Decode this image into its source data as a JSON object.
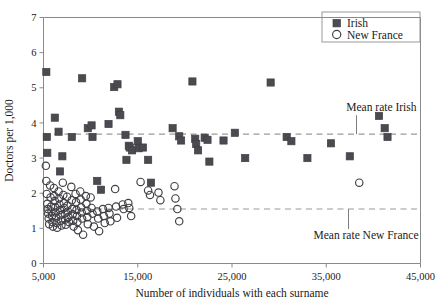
{
  "chart_data": {
    "type": "scatter",
    "title": "",
    "xlabel": "Number of individuals with each surname",
    "ylabel": "Doctors per 1,000",
    "xlim": [
      5000,
      45000
    ],
    "ylim": [
      0,
      7
    ],
    "xticks": [
      5000,
      15000,
      25000,
      35000,
      45000
    ],
    "xticklabels": [
      "5,000",
      "15,000",
      "25,000",
      "35,000",
      "45,000"
    ],
    "yticks": [
      0,
      1,
      2,
      3,
      4,
      5,
      6,
      7
    ],
    "yticklabels": [
      "0",
      "1",
      "2",
      "3",
      "4",
      "5",
      "6",
      "7"
    ],
    "grid": false,
    "legend_position": "top-right",
    "legend": [
      {
        "name": "Irish",
        "marker": "filled-square",
        "color": "#4a4a50"
      },
      {
        "name": "New France",
        "marker": "open-circle",
        "color": "#3f3f44"
      }
    ],
    "annotations": [
      {
        "text": "Mean rate Irish",
        "y_value": 3.68
      },
      {
        "text": "Mean rate New France",
        "y_value": 1.55
      }
    ],
    "reference_lines": [
      {
        "label": "Mean rate Irish",
        "series": "Irish",
        "y": 3.68,
        "style": "dashed"
      },
      {
        "label": "Mean rate New France",
        "series": "New France",
        "y": 1.55,
        "style": "dashed"
      }
    ],
    "series": [
      {
        "name": "Irish",
        "marker": "filled-square",
        "color": "#4a4a50",
        "points": [
          [
            5300,
            5.45
          ],
          [
            5350,
            3.6
          ],
          [
            5400,
            3.15
          ],
          [
            6200,
            4.15
          ],
          [
            6600,
            3.75
          ],
          [
            6750,
            2.62
          ],
          [
            7000,
            3.05
          ],
          [
            8000,
            3.6
          ],
          [
            9100,
            5.27
          ],
          [
            9700,
            3.85
          ],
          [
            10100,
            3.93
          ],
          [
            10200,
            3.6
          ],
          [
            10700,
            2.35
          ],
          [
            11100,
            2.1
          ],
          [
            11900,
            3.97
          ],
          [
            12500,
            5.02
          ],
          [
            12850,
            5.1
          ],
          [
            13000,
            4.32
          ],
          [
            13150,
            4.22
          ],
          [
            13700,
            3.66
          ],
          [
            13800,
            2.95
          ],
          [
            14050,
            3.35
          ],
          [
            14150,
            3.3
          ],
          [
            14400,
            3.22
          ],
          [
            15000,
            3.48
          ],
          [
            15100,
            3.28
          ],
          [
            15550,
            3.3
          ],
          [
            16100,
            2.95
          ],
          [
            16400,
            2.3
          ],
          [
            18700,
            3.85
          ],
          [
            19400,
            3.62
          ],
          [
            19600,
            3.5
          ],
          [
            20800,
            5.18
          ],
          [
            21100,
            3.55
          ],
          [
            21200,
            3.4
          ],
          [
            21400,
            3.22
          ],
          [
            22100,
            3.58
          ],
          [
            22400,
            3.52
          ],
          [
            22600,
            2.9
          ],
          [
            24100,
            3.5
          ],
          [
            25300,
            3.72
          ],
          [
            26400,
            3.0
          ],
          [
            29100,
            5.15
          ],
          [
            30800,
            3.6
          ],
          [
            31300,
            3.48
          ],
          [
            33000,
            3.0
          ],
          [
            35500,
            3.42
          ],
          [
            37500,
            3.05
          ],
          [
            40600,
            4.2
          ],
          [
            41200,
            3.85
          ],
          [
            41500,
            3.6
          ]
        ]
      },
      {
        "name": "New France",
        "marker": "open-circle",
        "color": "#3f3f44",
        "points": [
          [
            5250,
            2.78
          ],
          [
            5300,
            2.35
          ],
          [
            5350,
            1.98
          ],
          [
            5400,
            1.7
          ],
          [
            5450,
            1.55
          ],
          [
            5500,
            1.42
          ],
          [
            5550,
            1.28
          ],
          [
            5600,
            1.12
          ],
          [
            5700,
            2.22
          ],
          [
            5750,
            1.88
          ],
          [
            5800,
            1.62
          ],
          [
            5850,
            1.48
          ],
          [
            5900,
            1.35
          ],
          [
            5950,
            1.18
          ],
          [
            6000,
            1.05
          ],
          [
            6100,
            2.15
          ],
          [
            6150,
            1.92
          ],
          [
            6200,
            1.78
          ],
          [
            6250,
            1.6
          ],
          [
            6300,
            1.45
          ],
          [
            6350,
            1.3
          ],
          [
            6400,
            1.15
          ],
          [
            6450,
            1.02
          ],
          [
            6600,
            2.05
          ],
          [
            6650,
            1.85
          ],
          [
            6700,
            1.68
          ],
          [
            6750,
            1.52
          ],
          [
            6800,
            1.38
          ],
          [
            6850,
            1.22
          ],
          [
            6900,
            1.08
          ],
          [
            7050,
            2.3
          ],
          [
            7100,
            1.95
          ],
          [
            7150,
            1.72
          ],
          [
            7200,
            1.58
          ],
          [
            7250,
            1.42
          ],
          [
            7300,
            1.25
          ],
          [
            7350,
            1.1
          ],
          [
            7500,
            1.9
          ],
          [
            7550,
            1.65
          ],
          [
            7600,
            1.48
          ],
          [
            7650,
            1.32
          ],
          [
            7700,
            1.18
          ],
          [
            7950,
            2.18
          ],
          [
            8000,
            1.8
          ],
          [
            8050,
            1.55
          ],
          [
            8100,
            1.4
          ],
          [
            8150,
            1.22
          ],
          [
            8200,
            1.05
          ],
          [
            8400,
            1.98
          ],
          [
            8450,
            1.75
          ],
          [
            8500,
            1.52
          ],
          [
            8550,
            1.35
          ],
          [
            8600,
            1.18
          ],
          [
            8650,
            0.95
          ],
          [
            8900,
            2.05
          ],
          [
            8950,
            1.82
          ],
          [
            9000,
            1.6
          ],
          [
            9050,
            1.45
          ],
          [
            9100,
            1.28
          ],
          [
            9200,
            0.82
          ],
          [
            9500,
            1.92
          ],
          [
            9550,
            1.7
          ],
          [
            9600,
            1.5
          ],
          [
            9650,
            1.32
          ],
          [
            9700,
            1.12
          ],
          [
            10000,
            1.88
          ],
          [
            10100,
            1.58
          ],
          [
            10200,
            1.42
          ],
          [
            10350,
            1.05
          ],
          [
            10700,
            1.48
          ],
          [
            10800,
            1.28
          ],
          [
            10900,
            0.92
          ],
          [
            11300,
            1.55
          ],
          [
            11400,
            1.35
          ],
          [
            11500,
            1.15
          ],
          [
            11900,
            1.58
          ],
          [
            12000,
            1.42
          ],
          [
            12100,
            1.2
          ],
          [
            12600,
            2.12
          ],
          [
            12700,
            1.62
          ],
          [
            12800,
            1.3
          ],
          [
            13400,
            1.68
          ],
          [
            13500,
            1.55
          ],
          [
            14000,
            1.72
          ],
          [
            14100,
            1.58
          ],
          [
            14300,
            1.35
          ],
          [
            15300,
            2.32
          ],
          [
            16100,
            2.08
          ],
          [
            16300,
            1.95
          ],
          [
            17200,
            2.02
          ],
          [
            17400,
            1.8
          ],
          [
            18900,
            2.2
          ],
          [
            19000,
            1.85
          ],
          [
            19200,
            1.55
          ],
          [
            19400,
            1.2
          ],
          [
            38500,
            2.3
          ]
        ]
      }
    ]
  }
}
